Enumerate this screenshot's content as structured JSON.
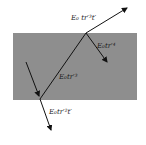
{
  "diagram": {
    "type": "multiple-reflection slab",
    "slab_color": "#8e8e8e",
    "ray_color": "#111111",
    "labels": {
      "exit_top": "E₀ tr′³t′",
      "reflect_inside": "E₀tr′⁴",
      "internal": "E₀tr′³",
      "exit_bottom": "E₀tr′²t′"
    }
  }
}
